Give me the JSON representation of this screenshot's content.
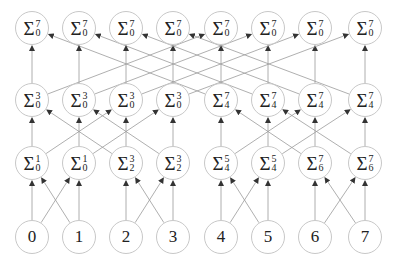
{
  "diagram": {
    "type": "prefix-sum butterfly network",
    "columns_x": [
      32,
      79,
      126,
      173,
      221,
      268,
      315,
      365
    ],
    "rows_y": [
      28,
      100,
      163,
      237
    ],
    "edge_color": "#9a9a9a",
    "node_border_color": "#c8c8c8",
    "rows": [
      {
        "name": "level-3",
        "nodes": [
          {
            "sup": "7",
            "sub": "0"
          },
          {
            "sup": "7",
            "sub": "0"
          },
          {
            "sup": "7",
            "sub": "0"
          },
          {
            "sup": "7",
            "sub": "0"
          },
          {
            "sup": "7",
            "sub": "0"
          },
          {
            "sup": "7",
            "sub": "0"
          },
          {
            "sup": "7",
            "sub": "0"
          },
          {
            "sup": "7",
            "sub": "0"
          }
        ]
      },
      {
        "name": "level-2",
        "nodes": [
          {
            "sup": "3",
            "sub": "0"
          },
          {
            "sup": "3",
            "sub": "0"
          },
          {
            "sup": "3",
            "sub": "0"
          },
          {
            "sup": "3",
            "sub": "0"
          },
          {
            "sup": "7",
            "sub": "4"
          },
          {
            "sup": "7",
            "sub": "4"
          },
          {
            "sup": "7",
            "sub": "4"
          },
          {
            "sup": "7",
            "sub": "4"
          }
        ]
      },
      {
        "name": "level-1",
        "nodes": [
          {
            "sup": "1",
            "sub": "0"
          },
          {
            "sup": "1",
            "sub": "0"
          },
          {
            "sup": "3",
            "sub": "2"
          },
          {
            "sup": "3",
            "sub": "2"
          },
          {
            "sup": "5",
            "sub": "4"
          },
          {
            "sup": "5",
            "sub": "4"
          },
          {
            "sup": "7",
            "sub": "6"
          },
          {
            "sup": "7",
            "sub": "6"
          }
        ]
      },
      {
        "name": "inputs",
        "nodes": [
          {
            "label": "0"
          },
          {
            "label": "1"
          },
          {
            "label": "2"
          },
          {
            "label": "3"
          },
          {
            "label": "4"
          },
          {
            "label": "5"
          },
          {
            "label": "6"
          },
          {
            "label": "7"
          }
        ]
      }
    ],
    "sigma_symbol": "Σ"
  }
}
